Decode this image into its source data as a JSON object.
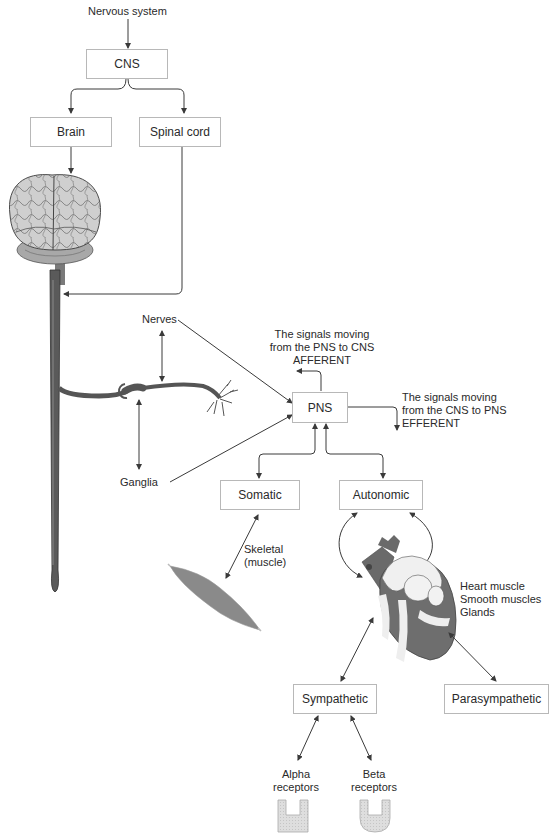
{
  "title": "Nervous system",
  "nodes": {
    "cns": "CNS",
    "brain": "Brain",
    "spinal_cord": "Spinal cord",
    "pns": "PNS",
    "somatic": "Somatic",
    "autonomic": "Autonomic",
    "sympathetic": "Sympathetic",
    "parasympathetic": "Parasympathetic"
  },
  "labels": {
    "nerves": "Nerves",
    "ganglia": "Ganglia",
    "afferent": [
      "The signals moving",
      "from the PNS to CNS",
      "AFFERENT"
    ],
    "efferent": [
      "The signals moving",
      "from the CNS to PNS",
      "EFFERENT"
    ],
    "skeletal": [
      "Skeletal",
      "(muscle)"
    ],
    "autonomic_targets": [
      "Heart muscle",
      "Smooth muscles",
      "Glands"
    ],
    "alpha": [
      "Alpha",
      "receptors"
    ],
    "beta": [
      "Beta",
      "receptors"
    ]
  },
  "illustrations": {
    "brain": "brain-illustration",
    "spinal_cord": "spinal-cord-illustration",
    "neuron": "neuron-illustration",
    "muscle": "skeletal-muscle-illustration",
    "heart": "heart-illustration",
    "alpha_receptor": "alpha-receptor-shape",
    "beta_receptor": "beta-receptor-shape"
  },
  "colors": {
    "line": "#3a3a3a",
    "box_border": "#b8b8b8",
    "brain_fill": "#c9c9c9",
    "spine_fill": "#5a5a5a",
    "muscle_fill": "#8a8a8a",
    "heart_dark": "#6a6a6a",
    "heart_light": "#efefef",
    "receptor_fill": "#dcdcdc"
  }
}
